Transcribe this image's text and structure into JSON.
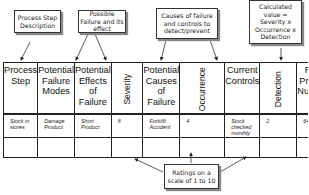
{
  "callouts": {
    "process_step": "Process Step Description",
    "failure": "Possible Failure and its effect",
    "causes": "Causes of failure and controls to detect/prevent",
    "rpn": "Calculated value = Severity x Occurrence x Detection",
    "ratings": "Ratings on a scale of 1 to 10"
  },
  "table": {
    "headers": [
      "Process Step",
      "Potential Failure Modes",
      "Potential Effects of Failure",
      "Severity",
      "Potential Causes of Failure",
      "Occurrence",
      "Current Controls",
      "Detection",
      "Risk Priority Number"
    ],
    "rows": [
      [
        "Stock in stores",
        "Damage Product",
        "Short Product",
        "8",
        "Forklift Accident",
        "4",
        "Stock checked monthly",
        "2",
        "64"
      ],
      [
        "",
        "",
        "",
        "",
        "",
        "",
        "",
        "",
        ""
      ]
    ]
  }
}
